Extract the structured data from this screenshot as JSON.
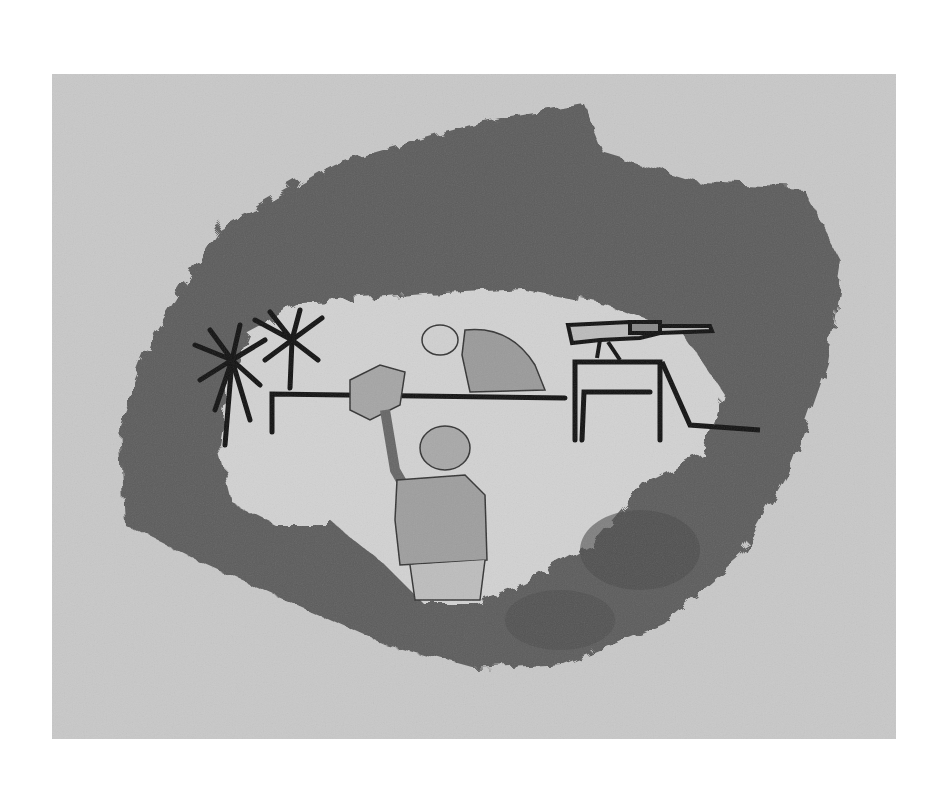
{
  "artwork": {
    "medium": "pencil drawing",
    "colors": {
      "page": "#ffffff",
      "paper": "#c8c8c8",
      "shading": "#5a5a5a",
      "clearing": "#d4d4d4",
      "ink": "#111111"
    },
    "elements": [
      "shaded-surround",
      "palm-tree-left",
      "palm-tree-right",
      "wall",
      "crouching-soldier",
      "soldier-raising-object",
      "mounted-machine-gun",
      "gun-table"
    ]
  }
}
